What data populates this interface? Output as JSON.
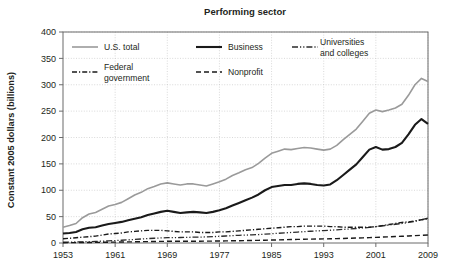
{
  "chart_data": {
    "type": "line",
    "title": "Performing sector",
    "xlabel": "",
    "ylabel": "Constant 2005 dollars (billions)",
    "xlim": [
      1953,
      2009
    ],
    "ylim": [
      0,
      400
    ],
    "yticks": [
      0,
      50,
      100,
      150,
      200,
      250,
      300,
      350,
      400
    ],
    "xticks": [
      1953,
      1961,
      1969,
      1977,
      1985,
      1993,
      2001,
      2009
    ],
    "grid": true,
    "legend_position": "top-inside",
    "x": [
      1953,
      1954,
      1955,
      1956,
      1957,
      1958,
      1959,
      1960,
      1961,
      1962,
      1963,
      1964,
      1965,
      1966,
      1967,
      1968,
      1969,
      1970,
      1971,
      1972,
      1973,
      1974,
      1975,
      1976,
      1977,
      1978,
      1979,
      1980,
      1981,
      1982,
      1983,
      1984,
      1985,
      1986,
      1987,
      1988,
      1989,
      1990,
      1991,
      1992,
      1993,
      1994,
      1995,
      1996,
      1997,
      1998,
      1999,
      2000,
      2001,
      2002,
      2003,
      2004,
      2005,
      2006,
      2007,
      2008,
      2009
    ],
    "series": [
      {
        "name": "U.S. total",
        "color": "#9a9a9a",
        "style": "solid",
        "width": 1.6,
        "values": [
          30,
          33,
          37,
          48,
          55,
          58,
          64,
          70,
          73,
          77,
          84,
          91,
          96,
          103,
          107,
          112,
          114,
          112,
          110,
          112,
          112,
          110,
          108,
          112,
          116,
          121,
          128,
          133,
          139,
          143,
          151,
          161,
          170,
          174,
          178,
          177,
          179,
          181,
          180,
          178,
          176,
          178,
          185,
          196,
          206,
          216,
          231,
          246,
          252,
          249,
          252,
          256,
          263,
          280,
          300,
          312,
          306
        ]
      },
      {
        "name": "Business",
        "color": "#1a1a1a",
        "style": "solid",
        "width": 2.1,
        "values": [
          18,
          19,
          21,
          26,
          29,
          30,
          33,
          36,
          38,
          40,
          43,
          46,
          49,
          53,
          56,
          59,
          61,
          59,
          57,
          58,
          59,
          58,
          57,
          59,
          62,
          66,
          71,
          76,
          81,
          86,
          92,
          100,
          106,
          108,
          110,
          110,
          112,
          113,
          112,
          110,
          109,
          111,
          119,
          129,
          139,
          149,
          163,
          177,
          182,
          177,
          178,
          182,
          190,
          206,
          224,
          235,
          226
        ]
      },
      {
        "name": "Universities and colleges",
        "color": "#2b2b2b",
        "style": "dashdotdot",
        "width": 1.3,
        "values": [
          1.5,
          1.7,
          2,
          2.3,
          2.6,
          3,
          3.5,
          4,
          4.6,
          5.2,
          6,
          6.8,
          7.6,
          8.4,
          9,
          9.6,
          10,
          10.2,
          10.4,
          10.7,
          11,
          11.2,
          11.5,
          12,
          12.6,
          13.3,
          14,
          14.6,
          15,
          15.4,
          16,
          16.8,
          17.6,
          18.4,
          19.2,
          20,
          20.8,
          21.6,
          22.3,
          23,
          23.6,
          24.2,
          25,
          25.8,
          26.6,
          27.5,
          28.5,
          29.6,
          31,
          32.5,
          34,
          35.5,
          37,
          39,
          41,
          44,
          47
        ]
      },
      {
        "name": "Federal government",
        "color": "#1a1a1a",
        "style": "dashdot",
        "width": 1.4,
        "values": [
          8,
          9,
          10,
          11,
          12,
          13,
          15,
          17,
          18,
          19,
          21,
          22,
          23,
          24,
          24,
          24,
          23,
          22,
          21,
          21,
          21,
          20,
          20,
          20,
          21,
          21,
          22,
          23,
          24,
          25,
          26,
          27,
          28,
          29,
          30,
          31,
          31,
          32,
          32,
          32,
          32,
          31,
          31,
          30,
          30,
          30,
          30,
          30,
          31,
          33,
          35,
          37,
          39,
          40,
          42,
          44,
          46
        ]
      },
      {
        "name": "Nonprofit",
        "color": "#1a1a1a",
        "style": "dashed",
        "width": 1.4,
        "values": [
          0.6,
          0.7,
          0.8,
          0.9,
          1,
          1.1,
          1.3,
          1.5,
          1.7,
          1.9,
          2.1,
          2.3,
          2.5,
          2.7,
          2.9,
          3.1,
          3.2,
          3.2,
          3.2,
          3.3,
          3.4,
          3.4,
          3.5,
          3.6,
          3.8,
          4,
          4.2,
          4.4,
          4.6,
          4.8,
          5,
          5.3,
          5.6,
          5.9,
          6.2,
          6.5,
          6.8,
          7.1,
          7.4,
          7.6,
          7.8,
          8,
          8.3,
          8.6,
          9,
          9.4,
          9.8,
          10.2,
          10.7,
          11.2,
          11.7,
          12.2,
          12.7,
          13.3,
          14,
          14.6,
          15.2
        ]
      }
    ],
    "legend": [
      {
        "label": "U.S. total",
        "style": "solid",
        "color": "#9a9a9a"
      },
      {
        "label": "Business",
        "style": "solid",
        "color": "#1a1a1a"
      },
      {
        "label": "Universities and colleges",
        "label_line1": "Universities",
        "label_line2": "and colleges",
        "style": "dashdotdot",
        "color": "#2b2b2b"
      },
      {
        "label": "Federal government",
        "label_line1": "Federal",
        "label_line2": "government",
        "style": "dashdot",
        "color": "#1a1a1a"
      },
      {
        "label": "Nonprofit",
        "style": "dashed",
        "color": "#1a1a1a"
      }
    ]
  }
}
